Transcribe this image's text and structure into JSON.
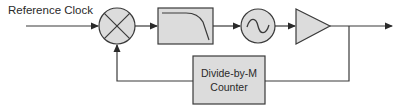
{
  "diagram": {
    "type": "PLL block diagram",
    "input_label": "Reference Clock",
    "blocks": [
      {
        "id": "mixer",
        "shape": "circle-x",
        "name": "Phase detector / mixer"
      },
      {
        "id": "filter",
        "shape": "box",
        "name": "Low-pass filter"
      },
      {
        "id": "vco",
        "shape": "circle-sine",
        "name": "Oscillator (VCO)"
      },
      {
        "id": "amp",
        "shape": "triangle",
        "name": "Amplifier/buffer"
      },
      {
        "id": "divider",
        "shape": "box",
        "line1": "Divide-by-M",
        "line2": "Counter"
      }
    ],
    "colors": {
      "fill": "#dcdcdc",
      "stroke": "#3a3a3a",
      "text": "#2a2a2a"
    }
  }
}
